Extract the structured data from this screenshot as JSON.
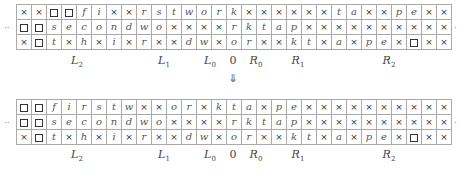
{
  "legend": {
    "cross_symbol": "×",
    "box_symbol": "□"
  },
  "top_tape": {
    "rows": [
      [
        "×",
        "×",
        "□",
        "□",
        "f",
        "i",
        "×",
        "×",
        "r",
        "s",
        "t",
        "w",
        "o",
        "r",
        "k",
        "×",
        "×",
        "×",
        "×",
        "×",
        "×",
        "t",
        "a",
        "×",
        "×",
        "p",
        "e",
        "×",
        "×"
      ],
      [
        "□",
        "□",
        "s",
        "e",
        "c",
        "o",
        "n",
        "d",
        "w",
        "o",
        "×",
        "×",
        "×",
        "×",
        "r",
        "k",
        "t",
        "a",
        "p",
        "×",
        "×",
        "×",
        "×",
        "×",
        "×",
        "×",
        "×",
        "×",
        "×"
      ],
      [
        "×",
        "□",
        "t",
        "×",
        "h",
        "×",
        "i",
        "×",
        "r",
        "×",
        "×",
        "d",
        "w",
        "×",
        "o",
        "r",
        "×",
        "×",
        "k",
        "t",
        "×",
        "a",
        "×",
        "p",
        "e",
        "×",
        "□",
        "×",
        "×"
      ]
    ],
    "left_ellipsis": "··",
    "right_ellipsis": "·"
  },
  "bottom_tape": {
    "rows": [
      [
        "□",
        "□",
        "f",
        "i",
        "r",
        "s",
        "t",
        "w",
        "×",
        "×",
        "o",
        "r",
        "×",
        "k",
        "t",
        "a",
        "×",
        "p",
        "e",
        "×",
        "×",
        "×",
        "×",
        "×",
        "×",
        "×",
        "×",
        "×",
        "×"
      ],
      [
        "□",
        "□",
        "s",
        "e",
        "c",
        "o",
        "n",
        "d",
        "w",
        "o",
        "×",
        "×",
        "×",
        "×",
        "r",
        "k",
        "t",
        "a",
        "p",
        "×",
        "×",
        "×",
        "×",
        "×",
        "×",
        "×",
        "×",
        "×",
        "×"
      ],
      [
        "×",
        "□",
        "t",
        "×",
        "h",
        "×",
        "i",
        "×",
        "r",
        "×",
        "×",
        "d",
        "w",
        "×",
        "o",
        "r",
        "×",
        "×",
        "k",
        "t",
        "×",
        "a",
        "×",
        "p",
        "e",
        "×",
        "□",
        "×",
        "×"
      ]
    ],
    "left_ellipsis": "··",
    "right_ellipsis": "·"
  },
  "position_labels": [
    {
      "base": "L",
      "sub": "2",
      "x": 77
    },
    {
      "base": "L",
      "sub": "1",
      "x": 164
    },
    {
      "base": "L",
      "sub": "0",
      "x": 210
    },
    {
      "base": "0",
      "sub": "",
      "x": 233
    },
    {
      "base": "R",
      "sub": "0",
      "x": 256
    },
    {
      "base": "R",
      "sub": "1",
      "x": 298
    },
    {
      "base": "R",
      "sub": "2",
      "x": 389
    }
  ],
  "transition_arrow": "⇓"
}
